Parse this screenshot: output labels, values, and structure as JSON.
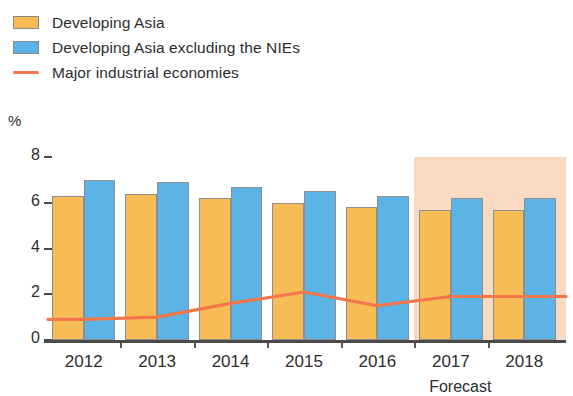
{
  "legend": {
    "items": [
      {
        "label": "Developing Asia",
        "type": "swatch",
        "color": "#F7BC56",
        "icon": "square-swatch-orange"
      },
      {
        "label": "Developing Asia excluding the NIEs",
        "type": "swatch",
        "color": "#5BB4E5",
        "icon": "square-swatch-blue"
      },
      {
        "label": "Major industrial economies",
        "type": "line",
        "color": "#F2764B",
        "icon": "line-swatch-red"
      }
    ]
  },
  "axis": {
    "y_unit": "%",
    "y_ticks": [
      "8",
      "6",
      "4",
      "2",
      "0"
    ],
    "x_labels": [
      "2012",
      "2013",
      "2014",
      "2015",
      "2016",
      "2017",
      "2018"
    ],
    "forecast_note": "Forecast"
  },
  "colors": {
    "series_a": "#F7BC56",
    "series_b": "#5BB4E5",
    "line": "#F2764B",
    "forecast_band": "#F8DAC2",
    "axis": "#4a4a4a"
  },
  "chart_data": {
    "type": "bar",
    "title": "",
    "subtitle": "",
    "xlabel": "",
    "ylabel": "%",
    "ylim": [
      0,
      8
    ],
    "yticks": [
      0,
      2,
      4,
      6,
      8
    ],
    "grid": false,
    "legend_position": "top-left",
    "categories": [
      "2012",
      "2013",
      "2014",
      "2015",
      "2016",
      "2017",
      "2018"
    ],
    "series": [
      {
        "name": "Developing Asia",
        "type": "bar",
        "color": "#F7BC56",
        "values": [
          6.3,
          6.4,
          6.2,
          6.0,
          5.8,
          5.7,
          5.7
        ]
      },
      {
        "name": "Developing Asia excluding the NIEs",
        "type": "bar",
        "color": "#5BB4E5",
        "values": [
          7.0,
          6.9,
          6.7,
          6.5,
          6.3,
          6.2,
          6.2
        ]
      },
      {
        "name": "Major industrial economies",
        "type": "line",
        "color": "#F2764B",
        "values": [
          0.9,
          1.0,
          1.6,
          2.1,
          1.5,
          1.9,
          1.9
        ]
      }
    ],
    "annotations": [
      {
        "text": "Forecast",
        "covers": [
          "2017",
          "2018"
        ],
        "style": "shaded-band",
        "color": "#F8DAC2"
      }
    ]
  }
}
